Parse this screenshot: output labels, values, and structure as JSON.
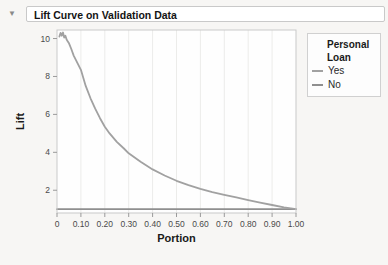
{
  "header": {
    "title": "Lift Curve on Validation Data",
    "disclosure_glyph": "▼"
  },
  "legend": {
    "title_line1": "Personal",
    "title_line2": "Loan",
    "items": [
      {
        "label": "Yes",
        "color": "#a1a1a1"
      },
      {
        "label": "No",
        "color": "#8f8f8f"
      }
    ]
  },
  "chart_data": {
    "type": "line",
    "title": "Lift Curve on Validation Data",
    "xlabel": "Portion",
    "ylabel": "Lift",
    "xlim": [
      0,
      1.0
    ],
    "ylim": [
      0.8,
      10.45
    ],
    "grid": "vertical-only",
    "legend_position": "right-outside",
    "xticks": {
      "values": [
        0,
        0.1,
        0.2,
        0.3,
        0.4,
        0.5,
        0.6,
        0.7,
        0.8,
        0.9,
        1.0
      ],
      "labels": [
        "0",
        "0.10",
        "0.20",
        "0.30",
        "0.40",
        "0.50",
        "0.60",
        "0.70",
        "0.80",
        "0.90",
        "1.00"
      ]
    },
    "yticks": {
      "values": [
        2,
        4,
        6,
        8,
        10
      ],
      "labels": [
        "2",
        "4",
        "6",
        "8",
        "10"
      ]
    },
    "series": [
      {
        "name": "Yes",
        "color": "#a1a1a1",
        "x": [
          0.01,
          0.015,
          0.02,
          0.025,
          0.03,
          0.035,
          0.04,
          0.045,
          0.05,
          0.06,
          0.07,
          0.08,
          0.09,
          0.1,
          0.12,
          0.14,
          0.16,
          0.18,
          0.2,
          0.22,
          0.25,
          0.28,
          0.3,
          0.35,
          0.4,
          0.45,
          0.5,
          0.55,
          0.6,
          0.65,
          0.7,
          0.75,
          0.8,
          0.85,
          0.9,
          0.95,
          1.0
        ],
        "y": [
          10.1,
          10.3,
          10.15,
          10.32,
          10.05,
          10.15,
          9.95,
          9.85,
          9.75,
          9.45,
          9.1,
          8.85,
          8.6,
          8.35,
          7.5,
          6.85,
          6.3,
          5.8,
          5.35,
          5.0,
          4.55,
          4.2,
          3.95,
          3.5,
          3.1,
          2.78,
          2.5,
          2.27,
          2.07,
          1.9,
          1.76,
          1.62,
          1.48,
          1.35,
          1.22,
          1.1,
          1.0
        ]
      },
      {
        "name": "No",
        "color": "#8f8f8f",
        "x": [
          0.0,
          1.0
        ],
        "y": [
          1.0,
          1.0
        ]
      }
    ]
  }
}
